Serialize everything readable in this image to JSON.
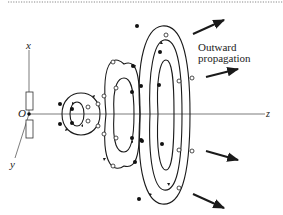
{
  "colors": {
    "line": "#1a1a1a",
    "dotted_border": "#888888",
    "background": "#ffffff"
  },
  "axes": {
    "x_label": "x",
    "y_label": "y",
    "z_label": "z",
    "origin_label": "O"
  },
  "annotation": {
    "line1": "Outward",
    "line2": "propagation"
  },
  "legend_markers": {
    "filled_dot": "field into page",
    "open_circle": "field out of page"
  }
}
